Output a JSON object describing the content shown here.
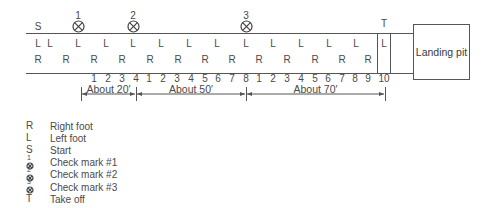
{
  "diagram": {
    "start_label": "S",
    "takeoff_label": "T",
    "landing_pit_label": "Landing pit",
    "check_marks": [
      {
        "number": "1",
        "x": 78
      },
      {
        "number": "2",
        "x": 133
      },
      {
        "number": "3",
        "x": 246
      }
    ],
    "left_foot_row": {
      "letter": "L",
      "x_positions": [
        38,
        50,
        78,
        106,
        133,
        161,
        189,
        217,
        246,
        273,
        301,
        329,
        356,
        384
      ]
    },
    "right_foot_row": {
      "letter": "R",
      "x_positions": [
        38,
        66,
        94,
        122,
        150,
        178,
        205,
        232,
        259,
        287,
        315,
        342,
        368
      ]
    },
    "stride_counts": [
      {
        "label": "1",
        "x": 94
      },
      {
        "label": "2",
        "x": 108
      },
      {
        "label": "3",
        "x": 122
      },
      {
        "label": "4",
        "x": 136
      },
      {
        "label": "1",
        "x": 149
      },
      {
        "label": "2",
        "x": 163
      },
      {
        "label": "3",
        "x": 177
      },
      {
        "label": "4",
        "x": 191
      },
      {
        "label": "5",
        "x": 205
      },
      {
        "label": "6",
        "x": 218
      },
      {
        "label": "7",
        "x": 232
      },
      {
        "label": "8",
        "x": 246
      },
      {
        "label": "1",
        "x": 259
      },
      {
        "label": "2",
        "x": 273
      },
      {
        "label": "3",
        "x": 287
      },
      {
        "label": "4",
        "x": 301
      },
      {
        "label": "5",
        "x": 315
      },
      {
        "label": "6",
        "x": 328
      },
      {
        "label": "7",
        "x": 342
      },
      {
        "label": "8",
        "x": 355
      },
      {
        "label": "9",
        "x": 368
      },
      {
        "label": "10",
        "x": 384
      }
    ],
    "distances": [
      {
        "label": "About 20′",
        "from_x": 81,
        "to_x": 136
      },
      {
        "label": "About 50′",
        "from_x": 136,
        "to_x": 246
      },
      {
        "label": "About 70′",
        "from_x": 246,
        "to_x": 385
      }
    ]
  },
  "legend": {
    "items": [
      {
        "symbol": "R",
        "label": "Right foot"
      },
      {
        "symbol": "L",
        "label": "Left foot"
      },
      {
        "symbol": "S",
        "label": "Start"
      },
      {
        "symbol": "check-mark-1",
        "number": "1",
        "label": "Check mark #1"
      },
      {
        "symbol": "check-mark-2",
        "number": "2",
        "label": "Check mark #2"
      },
      {
        "symbol": "check-mark-3",
        "number": "3",
        "label": "Check mark #3"
      },
      {
        "symbol": "T",
        "label": "Take off"
      }
    ]
  }
}
